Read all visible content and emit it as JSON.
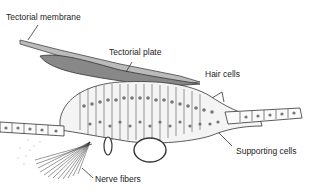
{
  "diagram": {
    "labels": {
      "tectorial_membrane": "Tectorial membrane",
      "tectorial_plate": "Tectorial plate",
      "hair_cells": "Hair cells",
      "supporting_cells": "Supporting cells",
      "nerve_fibers": "Nerve fibers"
    },
    "colors": {
      "ink": "#333333",
      "background": "#ffffff"
    }
  }
}
